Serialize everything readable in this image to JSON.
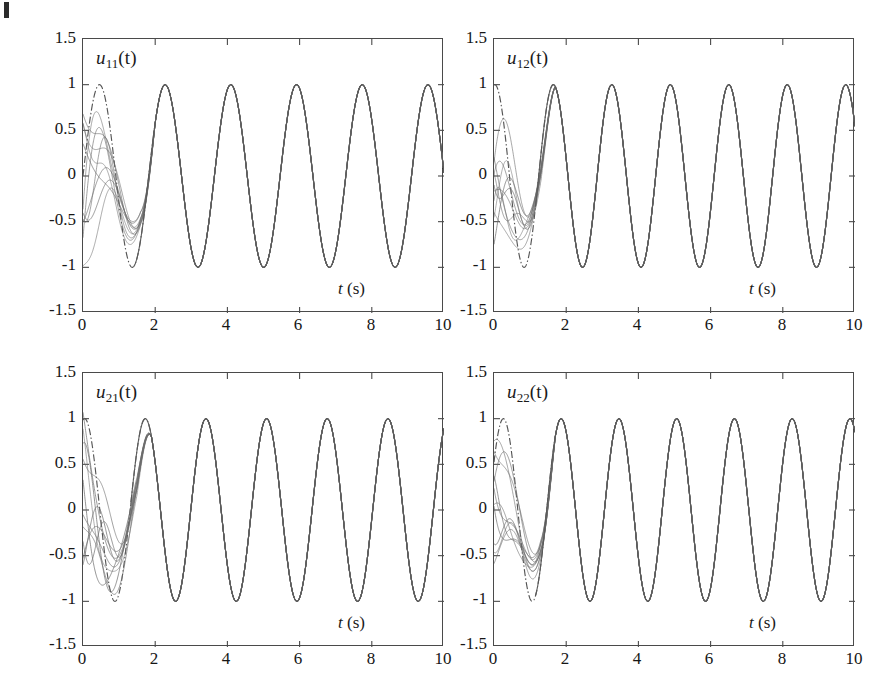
{
  "figure": {
    "background_color": "#ffffff",
    "axis_color": "#4a4a4a",
    "reference_color": "#555555",
    "trajectory_color": "#6b6b6b",
    "converged_color": "#5a5a5a",
    "corner_mark": "page-corner-artifact"
  },
  "axes_common": {
    "xlabel": "t (s)",
    "xlabel_italic": "t",
    "xlabel_unit": "(s)",
    "yticks": [
      "1.5",
      "1",
      "0.5",
      "0",
      "-0.5",
      "-1",
      "-1.5"
    ],
    "ytick_values": [
      1.5,
      1,
      0.5,
      0,
      -0.5,
      -1,
      -1.5
    ],
    "xticks": [
      "0",
      "2",
      "4",
      "6",
      "8",
      "10"
    ],
    "xtick_values": [
      0,
      2,
      4,
      6,
      8,
      10
    ],
    "xlim": [
      0,
      10
    ],
    "ylim": [
      -1.5,
      1.5
    ],
    "grid": false,
    "legend": "none"
  },
  "panels": [
    {
      "id": "u11",
      "label_base": "u",
      "label_sub": "11",
      "label_arg": "(t)",
      "label_full": "u11(t)",
      "position": "top-left",
      "xlabel": "t (s)"
    },
    {
      "id": "u12",
      "label_base": "u",
      "label_sub": "12",
      "label_arg": "(t)",
      "label_full": "u12(t)",
      "position": "top-right",
      "xlabel": "t (s)"
    },
    {
      "id": "u21",
      "label_base": "u",
      "label_sub": "21",
      "label_arg": "(t)",
      "label_full": "u21(t)",
      "position": "bottom-left",
      "xlabel": "t (s)"
    },
    {
      "id": "u22",
      "label_base": "u",
      "label_sub": "22",
      "label_arg": "(t)",
      "label_full": "u22(t)",
      "position": "bottom-right",
      "xlabel": "t (s)"
    }
  ],
  "chart_data": [
    {
      "type": "line",
      "id": "u11",
      "title": "u11(t)",
      "xlabel": "t (s)",
      "ylabel": "",
      "xlim": [
        0,
        10
      ],
      "ylim": [
        -1.5,
        1.5
      ],
      "xticks": [
        0,
        2,
        4,
        6,
        8,
        10
      ],
      "yticks": [
        -1.5,
        -1,
        -0.5,
        0,
        0.5,
        1,
        1.5
      ],
      "grid": false,
      "legend": "none",
      "series": [
        {
          "name": "reference (dash-dot)",
          "style": "dashdot",
          "amplitude": 1.0,
          "period_s": 1.82,
          "phase_rad": 0.0,
          "offset": 0.0,
          "description": "unit-amplitude reference sinusoid spanning about 5.5 cycles over 10 s, starting near 0 rising to +1 at t=0.45"
        },
        {
          "name": "learning trajectories (10 iterations)",
          "style": "solid",
          "count": 10,
          "transient_window_s": [
            0.0,
            1.6
          ],
          "converged_after_s": 2.0,
          "description": "ten iteration trajectories scattering between -0.6 and +0.9 during the first 1.6 s then locking onto the reference sinusoid"
        }
      ],
      "annotations": [
        "u11(t)",
        "t (s)"
      ]
    },
    {
      "type": "line",
      "id": "u12",
      "title": "u12(t)",
      "xlabel": "t (s)",
      "ylabel": "",
      "xlim": [
        0,
        10
      ],
      "ylim": [
        -1.5,
        1.5
      ],
      "xticks": [
        0,
        2,
        4,
        6,
        8,
        10
      ],
      "yticks": [
        -1.5,
        -1,
        -0.5,
        0,
        0.5,
        1,
        1.5
      ],
      "grid": false,
      "legend": "none",
      "series": [
        {
          "name": "reference (dash-dot)",
          "style": "dashdot",
          "amplitude": 1.0,
          "period_s": 1.62,
          "phase_rad": 1.48,
          "offset": 0.0,
          "description": "unit-amplitude reference sinusoid starting near +0.95 at t=0, about 6 cycles over 10 s"
        },
        {
          "name": "learning trajectories (10 iterations)",
          "style": "solid",
          "count": 10,
          "transient_window_s": [
            0.0,
            1.3
          ],
          "converged_after_s": 1.7,
          "description": "ten iteration trajectories spreading between -0.85 and +0.95 in the first 1.3 s then tracking the reference"
        }
      ],
      "annotations": [
        "u12(t)",
        "t (s)"
      ]
    },
    {
      "type": "line",
      "id": "u21",
      "title": "u21(t)",
      "xlabel": "t (s)",
      "ylabel": "",
      "xlim": [
        0,
        10
      ],
      "ylim": [
        -1.5,
        1.5
      ],
      "xticks": [
        0,
        2,
        4,
        6,
        8,
        10
      ],
      "yticks": [
        -1.5,
        -1,
        -0.5,
        0,
        0.5,
        1,
        1.5
      ],
      "grid": false,
      "legend": "none",
      "series": [
        {
          "name": "reference (dash-dot)",
          "style": "dashdot",
          "amplitude": 1.0,
          "period_s": 1.68,
          "phase_rad": 1.4,
          "offset": 0.0,
          "description": "unit-amplitude reference sinusoid starting near +0.95, about 6 cycles over 10 s"
        },
        {
          "name": "learning trajectories (10 iterations)",
          "style": "solid",
          "count": 10,
          "transient_window_s": [
            0.0,
            1.5
          ],
          "converged_after_s": 1.9,
          "description": "ten iteration trajectories forming a braided bundle between -0.9 and +1.0 before converging"
        }
      ],
      "annotations": [
        "u21(t)",
        "t (s)"
      ]
    },
    {
      "type": "line",
      "id": "u22",
      "title": "u22(t)",
      "xlabel": "t (s)",
      "ylabel": "",
      "xlim": [
        0,
        10
      ],
      "ylim": [
        -1.5,
        1.5
      ],
      "xticks": [
        0,
        2,
        4,
        6,
        8,
        10
      ],
      "yticks": [
        -1.5,
        -1,
        -0.5,
        0,
        0.5,
        1,
        1.5
      ],
      "grid": false,
      "legend": "none",
      "series": [
        {
          "name": "reference (dash-dot)",
          "style": "dashdot",
          "amplitude": 1.0,
          "period_s": 1.6,
          "phase_rad": 0.55,
          "offset": 0.0,
          "description": "unit-amplitude reference sinusoid starting near +0.5 and peaking early, about 6 cycles over 10 s"
        },
        {
          "name": "learning trajectories (10 iterations)",
          "style": "solid",
          "count": 10,
          "transient_window_s": [
            0.0,
            1.3
          ],
          "converged_after_s": 1.7,
          "description": "ten iteration trajectories scattered between -1.0 and +0.8 early then settling onto the reference"
        }
      ],
      "annotations": [
        "u22(t)",
        "t (s)"
      ]
    }
  ]
}
